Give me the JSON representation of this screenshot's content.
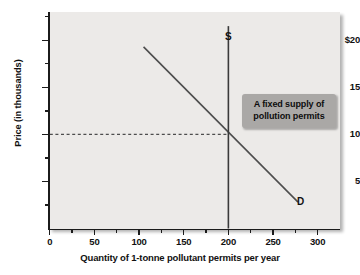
{
  "chart_data": {
    "type": "line",
    "title": "",
    "xlabel": "Quantity of 1-tonne pollutant permits  per year",
    "ylabel": "Price (in thousands)",
    "xlim": [
      0,
      325
    ],
    "ylim": [
      0,
      23
    ],
    "grid": false,
    "legend": "inline-labels",
    "x_ticks": [
      {
        "value": 0,
        "label": "0"
      },
      {
        "value": 25,
        "label": ""
      },
      {
        "value": 50,
        "label": "50"
      },
      {
        "value": 75,
        "label": ""
      },
      {
        "value": 100,
        "label": "100"
      },
      {
        "value": 125,
        "label": ""
      },
      {
        "value": 150,
        "label": "150"
      },
      {
        "value": 175,
        "label": ""
      },
      {
        "value": 200,
        "label": "200"
      },
      {
        "value": 225,
        "label": ""
      },
      {
        "value": 250,
        "label": "250"
      },
      {
        "value": 275,
        "label": ""
      },
      {
        "value": 300,
        "label": "300"
      }
    ],
    "y_ticks": [
      {
        "value": 2.5,
        "label": ""
      },
      {
        "value": 5,
        "label": "5"
      },
      {
        "value": 7.5,
        "label": ""
      },
      {
        "value": 10,
        "label": "10"
      },
      {
        "value": 12.5,
        "label": ""
      },
      {
        "value": 15,
        "label": "15"
      },
      {
        "value": 17.5,
        "label": ""
      },
      {
        "value": 20,
        "label": "$20"
      },
      {
        "value": 22.5,
        "label": ""
      }
    ],
    "series": [
      {
        "name": "D",
        "label": "D",
        "type": "line",
        "style": "solid",
        "color": "#4d4d4d",
        "points": [
          [
            105,
            19.3
          ],
          [
            278,
            2.8
          ]
        ]
      },
      {
        "name": "S",
        "label": "S",
        "type": "line",
        "style": "solid",
        "color": "#3a3a3a",
        "points": [
          [
            200,
            21.5
          ],
          [
            200,
            0
          ]
        ]
      },
      {
        "name": "equilibrium-price-guide",
        "label": "",
        "type": "line",
        "style": "dashed",
        "color": "#4d4d4d",
        "points": [
          [
            0,
            10
          ],
          [
            200,
            10
          ]
        ]
      }
    ],
    "equilibrium": {
      "quantity": 200,
      "price": 10
    },
    "annotations": [
      {
        "name": "fixed-supply-callout",
        "lines": [
          "A fixed supply of",
          "pollution permits"
        ],
        "background": "#aaa8a6",
        "text_color": "#0d0d0d"
      }
    ],
    "colors": {
      "plot_background": "#eceae8",
      "axis": "#1b1b1b",
      "demand_line": "#4d4d4d",
      "supply_line": "#3a3a3a",
      "callout_background": "#aaa8a6",
      "page_background": "#ffffff"
    }
  }
}
